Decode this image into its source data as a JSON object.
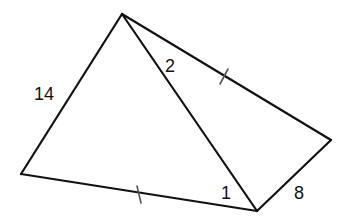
{
  "diagram": {
    "type": "geometry-figure",
    "vertices": {
      "A": {
        "x": 122,
        "y": 14,
        "role": "top"
      },
      "B": {
        "x": 21,
        "y": 174,
        "role": "left"
      },
      "C": {
        "x": 257,
        "y": 211,
        "role": "bottom"
      },
      "D": {
        "x": 331,
        "y": 140,
        "role": "right"
      }
    },
    "edges": [
      {
        "from": "A",
        "to": "B",
        "label": "14"
      },
      {
        "from": "B",
        "to": "C",
        "label": "",
        "tick_marks": 1
      },
      {
        "from": "C",
        "to": "D",
        "label": "8"
      },
      {
        "from": "D",
        "to": "A",
        "label": "",
        "tick_marks": 1
      },
      {
        "from": "A",
        "to": "C",
        "label": "",
        "diagonal": true
      }
    ],
    "labels": {
      "side_ab": "14",
      "side_cd": "8",
      "angle_at_a": "2",
      "angle_at_c": "1"
    },
    "colors": {
      "line": "#111111",
      "tick": "#555555",
      "background": "#ffffff"
    }
  }
}
